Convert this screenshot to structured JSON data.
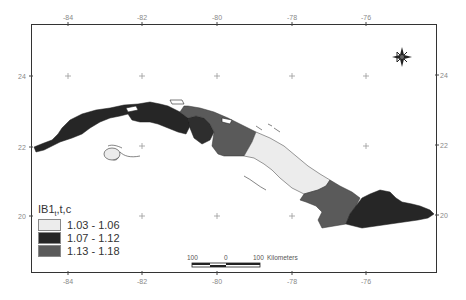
{
  "map": {
    "type": "choropleth",
    "region": "Cuba",
    "longitude_ticks_top": [
      "-84",
      "-82",
      "-80",
      "-78",
      "-76"
    ],
    "longitude_ticks_bottom": [
      "-84",
      "-82",
      "-80",
      "-78",
      "-76"
    ],
    "latitude_ticks_left": [
      "24",
      "22",
      "20"
    ],
    "latitude_ticks_right": [
      "24",
      "22",
      "20"
    ],
    "north_arrow": "compass-rose"
  },
  "legend": {
    "title": "IB1",
    "title_sub": "t",
    "title_suffix": ",t,c",
    "classes": [
      {
        "label": "1.03 - 1.06",
        "color": "#ececec"
      },
      {
        "label": "1.07 - 1.12",
        "color": "#262626"
      },
      {
        "label": "1.13 - 1.18",
        "color": "#5a5a5a"
      }
    ]
  },
  "scalebar": {
    "left_label": "100",
    "mid_label": "0",
    "right_label": "100",
    "units": "Kilometers"
  }
}
